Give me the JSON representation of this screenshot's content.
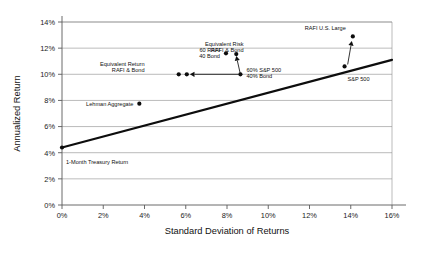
{
  "chart_data": {
    "type": "scatter",
    "title": "",
    "xlabel": "Standard Deviation of Returns",
    "ylabel": "Annualized Return",
    "xlim": [
      0,
      16
    ],
    "ylim": [
      0,
      14
    ],
    "xticks": [
      "0%",
      "2%",
      "4%",
      "6%",
      "8%",
      "10%",
      "12%",
      "14%",
      "16%"
    ],
    "yticks": [
      "0%",
      "2%",
      "4%",
      "6%",
      "8%",
      "10%",
      "12%",
      "14%"
    ],
    "xtick_values": [
      0,
      2,
      4,
      6,
      8,
      10,
      12,
      14,
      16
    ],
    "ytick_values": [
      0,
      2,
      4,
      6,
      8,
      10,
      12,
      14
    ],
    "grid": "horizontal",
    "legend": "none",
    "points": [
      {
        "label": "1-Month Treasury Return",
        "x": 0.0,
        "y": 4.4,
        "label_dx": 4,
        "label_dy": 17,
        "anchor": "start"
      },
      {
        "label": "Lehman Aggregate",
        "x": 3.75,
        "y": 7.75,
        "label_dx": -6,
        "label_dy": 2,
        "anchor": "end"
      },
      {
        "label": "60 RAFI",
        "x": 7.95,
        "y": 11.6,
        "label_dx": -6,
        "label_dy": -1,
        "anchor": "end"
      },
      {
        "label": "40 Bond",
        "x": 7.95,
        "y": 11.6,
        "label_dx": -6,
        "label_dy": 5,
        "anchor": "end"
      },
      {
        "label": "60% S&P 500",
        "x": 8.65,
        "y": 10.0,
        "label_dx": 6,
        "label_dy": -2,
        "anchor": "start"
      },
      {
        "label": "40% Bond",
        "x": 8.65,
        "y": 10.0,
        "label_dx": 6,
        "label_dy": 4,
        "anchor": "start"
      },
      {
        "label": "S&P 500",
        "x": 13.7,
        "y": 10.6,
        "label_dx": 3,
        "label_dy": 15,
        "anchor": "start"
      },
      {
        "label": "RAFI U.S. Large",
        "x": 14.1,
        "y": 12.9,
        "label_dx": -7,
        "label_dy": -6,
        "anchor": "end"
      }
    ],
    "extra_markers": [
      {
        "name": "equivalent-return-marker-a",
        "x": 5.66,
        "y": 10.0
      },
      {
        "name": "equivalent-return-marker-b",
        "x": 6.05,
        "y": 10.0
      },
      {
        "name": "equivalent-risk-marker",
        "x": 8.45,
        "y": 11.55
      }
    ],
    "capital_market_line": {
      "name": "Capital Market Line",
      "x_start": 0.0,
      "y_start": 4.4,
      "x_end": 16.0,
      "y_end": 11.1
    },
    "annotations": [
      {
        "name": "equivalent-risk",
        "line1": "Equivalent Risk",
        "line2": "RAFI & Bond",
        "x": 8.8,
        "y": 12.2
      },
      {
        "name": "equivalent-return",
        "line1": "Equivalent Return",
        "line2": "RAFI & Bond",
        "x": 4.0,
        "y": 10.6
      }
    ],
    "arrows": [
      {
        "name": "equivalent-risk-arrow",
        "x1": 8.65,
        "y1": 10.0,
        "x2": 8.45,
        "y2": 11.4
      },
      {
        "name": "equivalent-return-arrow",
        "x1": 8.55,
        "y1": 10.0,
        "x2": 6.2,
        "y2": 10.0
      },
      {
        "name": "sp500-to-rafi-arrow",
        "x1": 13.85,
        "y1": 10.75,
        "x2": 14.05,
        "y2": 12.55
      }
    ]
  }
}
